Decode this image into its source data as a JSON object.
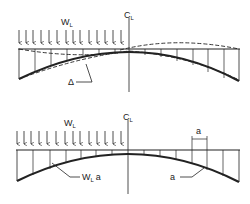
{
  "diagram": {
    "top": {
      "load_label": "W",
      "load_subscript": "L",
      "centerline_label": "C",
      "centerline_subscript": "L",
      "deflection_label": "Δ",
      "load_arrow_count": 14
    },
    "bottom": {
      "load_label": "W",
      "load_subscript": "L",
      "centerline_label": "C",
      "centerline_subscript": "L",
      "pressure_label": "W",
      "pressure_subscript": "L",
      "pressure_suffix": "a",
      "gap_label": "a",
      "curve_label": "a",
      "load_arrow_count": 14
    },
    "colors": {
      "ink": "#222222",
      "background": "#ffffff"
    }
  }
}
